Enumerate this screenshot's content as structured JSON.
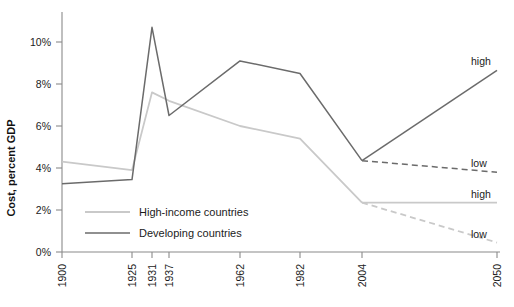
{
  "chart_data": {
    "type": "line",
    "title": "",
    "xlabel": "",
    "ylabel": "Cost, percent GDP",
    "categories": [
      "1900",
      "1925",
      "1931",
      "1937",
      "1962",
      "1982",
      "2004",
      "2050"
    ],
    "x_tick_labels": [
      "1900",
      "1925",
      "1931",
      "1937",
      "1962",
      "1982",
      "2004",
      "2050"
    ],
    "y_tick_labels": [
      "0%",
      "2%",
      "4%",
      "6%",
      "8%",
      "10%"
    ],
    "y_tick_values": [
      0,
      2,
      4,
      6,
      8,
      10
    ],
    "ylim": [
      0,
      11.3
    ],
    "grid": false,
    "legend_position": "bottom-left",
    "series": [
      {
        "name": "High-income countries",
        "color": "#c9c9c9",
        "style": "solid",
        "x": [
          "1900",
          "1925",
          "1931",
          "1937",
          "1962",
          "1982",
          "2004"
        ],
        "values": [
          4.3,
          3.9,
          7.6,
          7.2,
          6.0,
          5.4,
          2.35
        ]
      },
      {
        "name": "Developing countries",
        "color": "#6b6b6b",
        "style": "solid",
        "x": [
          "1900",
          "1925",
          "1931",
          "1937",
          "1962",
          "1982",
          "2004"
        ],
        "values": [
          3.25,
          3.45,
          10.7,
          6.5,
          9.1,
          8.5,
          4.35
        ]
      },
      {
        "name": "High-income countries high projection",
        "color": "#c9c9c9",
        "style": "solid",
        "x": [
          "2004",
          "2050"
        ],
        "values": [
          2.35,
          2.35
        ],
        "end_label": "high"
      },
      {
        "name": "High-income countries low projection",
        "color": "#c9c9c9",
        "style": "dashed",
        "x": [
          "2004",
          "2050"
        ],
        "values": [
          2.35,
          0.45
        ],
        "end_label": "low"
      },
      {
        "name": "Developing countries high projection",
        "color": "#6b6b6b",
        "style": "solid",
        "x": [
          "2004",
          "2050"
        ],
        "values": [
          4.35,
          8.65
        ],
        "end_label": "high"
      },
      {
        "name": "Developing countries low projection",
        "color": "#6b6b6b",
        "style": "dashed",
        "x": [
          "2004",
          "2050"
        ],
        "values": [
          4.35,
          3.8
        ],
        "end_label": "low"
      }
    ],
    "annotations": [
      {
        "text": "high",
        "series": "Developing countries high projection"
      },
      {
        "text": "low",
        "series": "Developing countries low projection"
      },
      {
        "text": "high",
        "series": "High-income countries high projection"
      },
      {
        "text": "low",
        "series": "High-income countries low projection"
      }
    ]
  },
  "legend": {
    "items": [
      {
        "label": "High-income countries",
        "color": "#c9c9c9"
      },
      {
        "label": "Developing countries",
        "color": "#6b6b6b"
      }
    ]
  },
  "axis": {
    "y_title": "Cost, percent GDP"
  }
}
